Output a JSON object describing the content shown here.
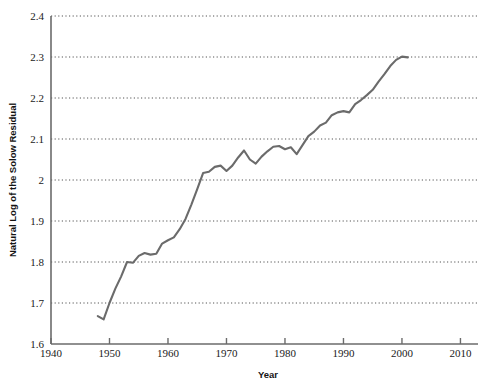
{
  "chart_data": {
    "type": "line",
    "title": "",
    "xlabel": "Year",
    "ylabel": "Natural Log of the Solow Residual",
    "xlim": [
      1940,
      2013
    ],
    "ylim": [
      1.6,
      2.4
    ],
    "xticks": [
      1940,
      1950,
      1960,
      1970,
      1980,
      1990,
      2000,
      2010
    ],
    "xtick_labels": [
      "1940",
      "1950",
      "1960",
      "1970",
      "1980",
      "1990",
      "2000",
      "2010"
    ],
    "yticks": [
      1.6,
      1.7,
      1.8,
      1.9,
      2.0,
      2.1,
      2.2,
      2.3,
      2.4
    ],
    "ytick_labels": [
      "1.6",
      "1.7",
      "1.8",
      "1.9",
      "2",
      "2.1",
      "2.2",
      "2.3",
      "2.4"
    ],
    "grid": "horizontal-dotted",
    "legend": "none",
    "line_color": "#6b6b6b",
    "axis_color": "#6b6b6b",
    "grid_color": "#555555",
    "series": [
      {
        "name": "Natural Log of the Solow Residual",
        "x": [
          1948,
          1949,
          1950,
          1951,
          1952,
          1953,
          1954,
          1955,
          1956,
          1957,
          1958,
          1959,
          1960,
          1961,
          1962,
          1963,
          1964,
          1965,
          1966,
          1967,
          1968,
          1969,
          1970,
          1971,
          1972,
          1973,
          1974,
          1975,
          1976,
          1977,
          1978,
          1979,
          1980,
          1981,
          1982,
          1983,
          1984,
          1985,
          1986,
          1987,
          1988,
          1989,
          1990,
          1991,
          1992,
          1993,
          1994,
          1995,
          1996,
          1997,
          1998,
          1999,
          2000,
          2001
        ],
        "values": [
          1.668,
          1.66,
          1.7,
          1.735,
          1.765,
          1.8,
          1.798,
          1.815,
          1.822,
          1.818,
          1.82,
          1.845,
          1.853,
          1.86,
          1.88,
          1.905,
          1.94,
          1.978,
          2.017,
          2.02,
          2.032,
          2.035,
          2.022,
          2.035,
          2.055,
          2.072,
          2.05,
          2.04,
          2.057,
          2.07,
          2.081,
          2.083,
          2.075,
          2.08,
          2.063,
          2.085,
          2.107,
          2.118,
          2.133,
          2.14,
          2.158,
          2.165,
          2.168,
          2.165,
          2.185,
          2.195,
          2.207,
          2.22,
          2.24,
          2.258,
          2.278,
          2.293,
          2.301,
          2.299
        ]
      }
    ]
  },
  "figure": {
    "x_axis_title": "Year",
    "y_axis_title": "Natural Log of the Solow Residual"
  }
}
